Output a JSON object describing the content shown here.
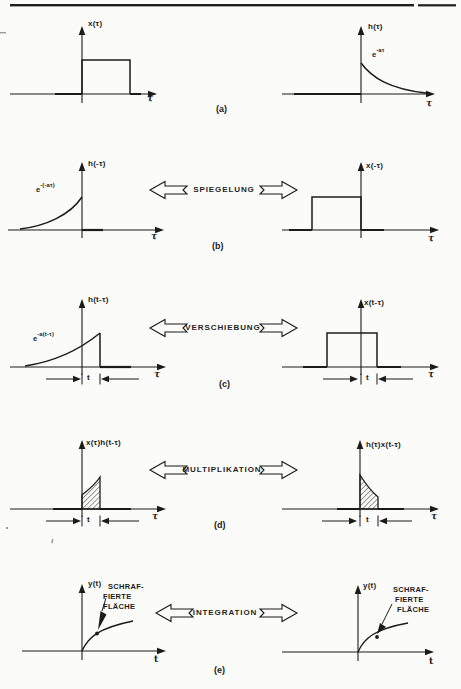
{
  "ops": {
    "spiegelung": "SPIEGELUNG",
    "verschiebung": "VERSCHIEBUNG",
    "multiplikation": "MULTIPLIKATION",
    "integration": "INTEGRATION"
  },
  "captions": {
    "a": "(a)",
    "b": "(b)",
    "c": "(c)",
    "d": "(d)",
    "e": "(e)"
  },
  "plots": {
    "a_left": {
      "ylabel": "x(τ)",
      "xlabel": "τ"
    },
    "a_right": {
      "ylabel": "h(τ)",
      "xlabel": "τ",
      "exp_base": "e",
      "exp_sup": "-aτ"
    },
    "b_left": {
      "ylabel": "h(-τ)",
      "xlabel": "τ",
      "exp_base": "e",
      "exp_sup": "-(-aτ)"
    },
    "b_right": {
      "ylabel": "x(-τ)",
      "xlabel": "τ"
    },
    "c_left": {
      "ylabel": "h(t-τ)",
      "xlabel": "τ",
      "exp_base": "e",
      "exp_sup": "-a(t-τ)",
      "shift": "t"
    },
    "c_right": {
      "ylabel": "x(t-τ)",
      "xlabel": "τ",
      "shift": "t"
    },
    "d_left": {
      "ylabel": "x(τ)h(t-τ)",
      "xlabel": "τ",
      "shift": "t"
    },
    "d_right": {
      "ylabel": "h(τ)x(t-τ)",
      "xlabel": "τ",
      "shift": "t"
    },
    "e_left": {
      "ylabel": "y(t)",
      "xlabel": "t",
      "annotation": [
        "SCHRAF-",
        "FIERTE",
        "FLÄCHE"
      ]
    },
    "e_right": {
      "ylabel": "y(t)",
      "xlabel": "t",
      "annotation": [
        "SCHRAF-",
        "FIERTE",
        "FLÄCHE"
      ]
    }
  },
  "colors": {
    "ink": "#1b1b1b",
    "paper": "#fbfbf9"
  }
}
